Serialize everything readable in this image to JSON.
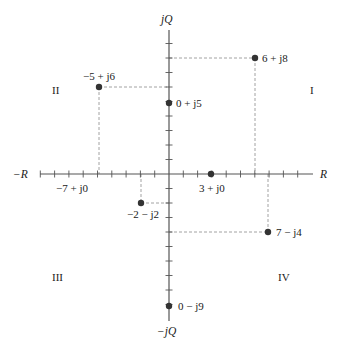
{
  "diagram": {
    "type": "complex-plane",
    "axes": {
      "real_positive": "R",
      "real_negative": "−R",
      "imag_positive": "jQ",
      "imag_negative": "−jQ"
    },
    "quadrants": [
      "I",
      "II",
      "III",
      "IV"
    ],
    "ticks": {
      "real_range": [
        -9,
        9
      ],
      "imag_range": [
        -10,
        10
      ]
    },
    "points": [
      {
        "label": "6 + j8",
        "re": 6,
        "im": 8,
        "dot": true,
        "guides": true
      },
      {
        "label": "−5 + j6",
        "re": -5,
        "im": 6,
        "dot": true,
        "guides": true
      },
      {
        "label": "0 + j5",
        "re": 0,
        "im": 5,
        "dot": true,
        "guides": false
      },
      {
        "label": "3 + j0",
        "re": 3,
        "im": 0,
        "dot": true,
        "guides": false
      },
      {
        "label": "−7 + j0",
        "re": -7,
        "im": 0,
        "dot": false,
        "guides": false
      },
      {
        "label": "−2 − j2",
        "re": -2,
        "im": -2,
        "dot": true,
        "guides": true
      },
      {
        "label": "7 − j4",
        "re": 7,
        "im": -4,
        "dot": true,
        "guides": true
      },
      {
        "label": "0 − j9",
        "re": 0,
        "im": -9,
        "dot": true,
        "guides": false
      }
    ],
    "colors": {
      "axis": "#555555",
      "dot": "#333333",
      "guide": "#8a8a8a",
      "text": "#1a1a1a"
    }
  }
}
